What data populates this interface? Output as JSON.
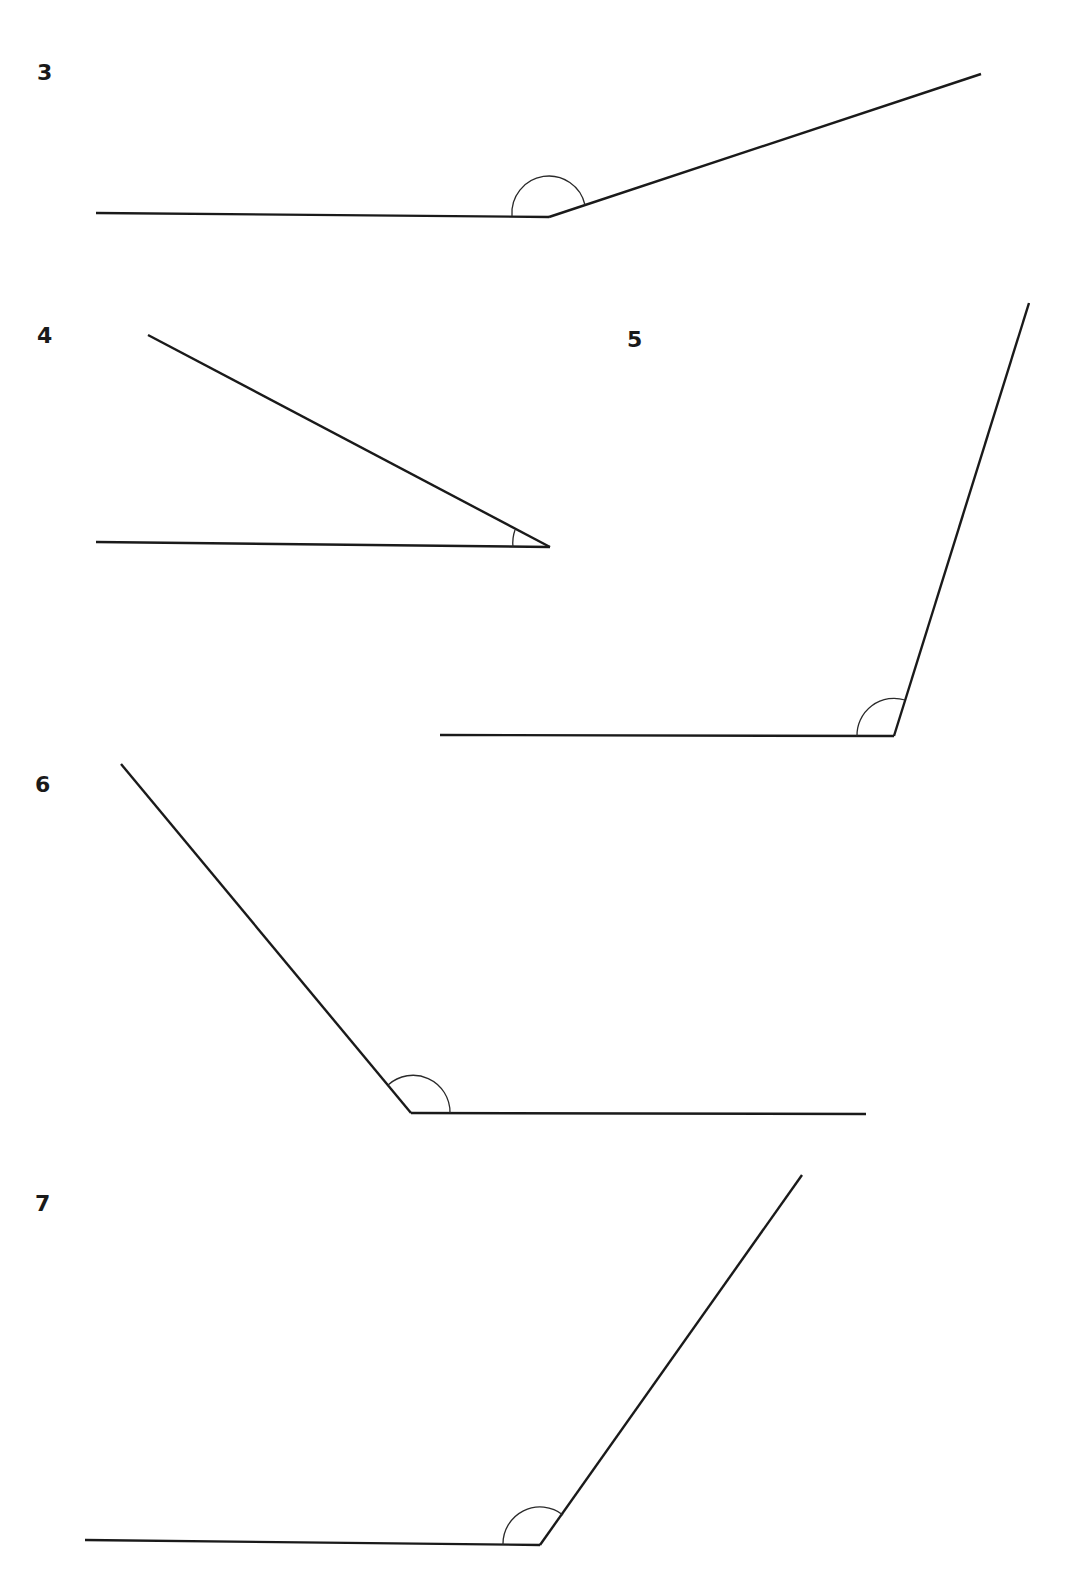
{
  "page": {
    "background": "#ffffff",
    "line_color": "#1a1a1a"
  },
  "angles": [
    {
      "label": "3",
      "label_pos": [
        37,
        62
      ],
      "vertex": [
        549,
        217
      ],
      "arm_a": [
        96,
        213
      ],
      "arm_b": [
        981,
        74
      ],
      "arc_radius": 38,
      "arc_type": "obtuse"
    },
    {
      "label": "4",
      "label_pos": [
        37,
        325
      ],
      "vertex": [
        550,
        547
      ],
      "arm_a": [
        96,
        542
      ],
      "arm_b": [
        148,
        335
      ],
      "arc_radius": 37,
      "arc_type": "acute"
    },
    {
      "label": "5",
      "label_pos": [
        627,
        329
      ],
      "vertex": [
        894,
        736
      ],
      "arm_a": [
        440,
        735
      ],
      "arm_b": [
        1029,
        303
      ],
      "arc_radius": 38,
      "arc_type": "obtuse"
    },
    {
      "label": "6",
      "label_pos": [
        35,
        774
      ],
      "vertex": [
        411,
        1113
      ],
      "arm_a": [
        866,
        1114
      ],
      "arm_b": [
        121,
        764
      ],
      "arc_radius": 38,
      "arc_type": "obtuse"
    },
    {
      "label": "7",
      "label_pos": [
        35,
        1193
      ],
      "vertex": [
        540,
        1545
      ],
      "arm_a": [
        85,
        1540
      ],
      "arm_b": [
        802,
        1175
      ],
      "arc_radius": 38,
      "arc_type": "obtuse"
    }
  ]
}
